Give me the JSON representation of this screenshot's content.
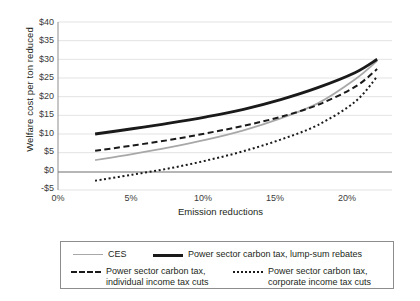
{
  "chart_data": {
    "type": "line",
    "title": "",
    "xlabel": "Emission reductions",
    "ylabel": "Welfare cost per ton reduced",
    "xlim": [
      0,
      22.5
    ],
    "ylim": [
      -5,
      40
    ],
    "grid": true,
    "legend_position": "bottom",
    "xticks": [
      "0%",
      "5%",
      "10%",
      "15%",
      "20%"
    ],
    "xtickvalues": [
      0,
      5,
      10,
      15,
      20
    ],
    "yticks": [
      "-$5",
      "$0",
      "$5",
      "$10",
      "$15",
      "$20",
      "$25",
      "$30",
      "$35",
      "$40"
    ],
    "ytickvalues": [
      -5,
      0,
      5,
      10,
      15,
      20,
      25,
      30,
      35,
      40
    ],
    "zero_line": 0,
    "x": [
      2.5,
      5,
      7.5,
      10,
      12.5,
      15,
      17.5,
      20,
      21.5
    ],
    "series": [
      {
        "name": "CES",
        "style": "solid-gray",
        "color": "#a8a8a8",
        "values": [
          3.0,
          4.6,
          6.4,
          8.5,
          11.0,
          14.2,
          18.2,
          24.6,
          29.6
        ]
      },
      {
        "name": "Power sector carbon tax, lump-sum rebates",
        "style": "solid-black",
        "color": "#1a1a1a",
        "values": [
          10.0,
          11.4,
          12.9,
          14.6,
          16.6,
          19.2,
          22.4,
          26.4,
          30.0
        ]
      },
      {
        "name": "Power sector carbon tax,\nindividual income tax cuts",
        "style": "dashed",
        "color": "#1a1a1a",
        "values": [
          5.5,
          6.9,
          8.4,
          10.2,
          12.2,
          14.6,
          17.8,
          22.6,
          27.4
        ]
      },
      {
        "name": "Power sector carbon tax,\ncorporate income tax cuts",
        "style": "dotted",
        "color": "#1a1a1a",
        "values": [
          -2.5,
          -0.9,
          0.8,
          2.9,
          5.4,
          8.5,
          12.4,
          18.6,
          25.4
        ]
      }
    ]
  },
  "axis": {
    "ylabel": "Welfare cost per ton reduced",
    "xlabel": "Emission reductions",
    "yticks": [
      "$40",
      "$35",
      "$30",
      "$25",
      "$20",
      "$15",
      "$10",
      "$5",
      "$0",
      "-$5"
    ],
    "xticks": [
      "0%",
      "5%",
      "10%",
      "15%",
      "20%"
    ]
  },
  "legend": {
    "items": [
      {
        "label": "CES",
        "style": "solid-gray"
      },
      {
        "label": "Power sector carbon tax, lump-sum rebates",
        "style": "solid-black"
      },
      {
        "label": "Power sector carbon tax,\nindividual income tax cuts",
        "style": "dashed"
      },
      {
        "label": "Power sector carbon tax,\ncorporate income tax cuts",
        "style": "dotted"
      }
    ]
  }
}
